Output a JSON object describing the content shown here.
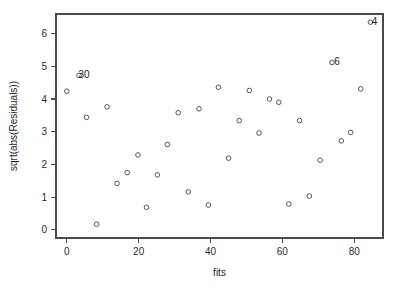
{
  "chart_data": {
    "type": "scatter",
    "title": "",
    "xlabel": "fits",
    "ylabel": "sqrt(abs(Residuals))",
    "xlim": [
      -3,
      88
    ],
    "ylim": [
      -0.25,
      6.6
    ],
    "xticks": [
      0,
      20,
      40,
      60,
      80
    ],
    "xticklabels": [
      "0",
      "20",
      "40",
      "60",
      "80"
    ],
    "yticks": [
      0,
      1,
      2,
      3,
      4,
      5,
      6
    ],
    "yticklabels": [
      "0",
      "1",
      "2",
      "3",
      "4",
      "5",
      "6"
    ],
    "grid": false,
    "legend": false,
    "marker": "open-circle",
    "marker_color": "#555555",
    "points": [
      {
        "x": 0.0,
        "y": 4.24
      },
      {
        "x": 5.5,
        "y": 3.44
      },
      {
        "x": 8.3,
        "y": 0.17
      },
      {
        "x": 11.2,
        "y": 3.76
      },
      {
        "x": 14.0,
        "y": 1.42
      },
      {
        "x": 16.8,
        "y": 1.75
      },
      {
        "x": 19.8,
        "y": 2.29
      },
      {
        "x": 22.2,
        "y": 0.69
      },
      {
        "x": 25.2,
        "y": 1.68
      },
      {
        "x": 28.0,
        "y": 2.61
      },
      {
        "x": 31.0,
        "y": 3.58
      },
      {
        "x": 33.8,
        "y": 1.16
      },
      {
        "x": 36.8,
        "y": 3.7
      },
      {
        "x": 39.4,
        "y": 0.76
      },
      {
        "x": 42.2,
        "y": 4.36
      },
      {
        "x": 45.0,
        "y": 2.19
      },
      {
        "x": 48.0,
        "y": 3.34
      },
      {
        "x": 50.8,
        "y": 4.26
      },
      {
        "x": 53.5,
        "y": 2.96
      },
      {
        "x": 56.4,
        "y": 4.0
      },
      {
        "x": 59.0,
        "y": 3.9
      },
      {
        "x": 61.8,
        "y": 0.79
      },
      {
        "x": 64.8,
        "y": 3.34
      },
      {
        "x": 67.5,
        "y": 1.03
      },
      {
        "x": 70.5,
        "y": 2.13
      },
      {
        "x": 73.8,
        "y": 5.12
      },
      {
        "x": 76.4,
        "y": 2.72
      },
      {
        "x": 79.0,
        "y": 2.98
      },
      {
        "x": 81.8,
        "y": 4.31
      },
      {
        "x": 84.5,
        "y": 6.35
      },
      {
        "x": 3.4,
        "y": 4.72
      }
    ],
    "annotations": [
      {
        "label": "30",
        "x": 3.4,
        "y": 4.72,
        "dx": 5,
        "dy": 3.5
      },
      {
        "label": "6",
        "x": 73.8,
        "y": 5.12,
        "dx": 5,
        "dy": 3.5
      },
      {
        "label": "4",
        "x": 84.5,
        "y": 6.35,
        "dx": 4,
        "dy": 3.5
      }
    ]
  }
}
